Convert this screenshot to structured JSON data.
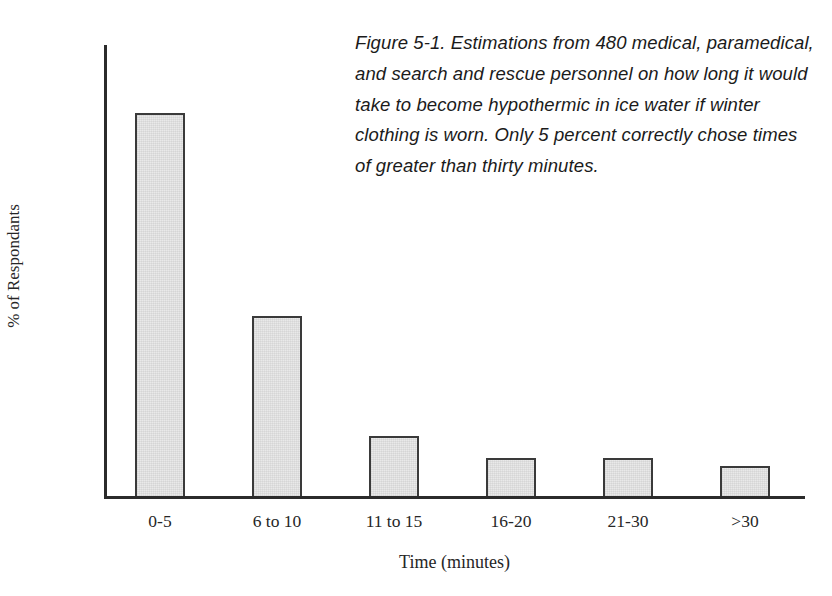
{
  "caption": {
    "text": "Figure 5-1. Estimations from 480 medical, paramedical, and search and rescue personnel on how long it would take to become hypothermic in ice water if winter clothing is worn. Only 5 percent correctly chose times of greater than thirty minutes."
  },
  "colors": {
    "bar_fill": "#e9e9e9",
    "bar_edge": "#3a3a3a",
    "axis": "#2b2b2b",
    "text": "#262626",
    "background": "#ffffff"
  },
  "chart_data": {
    "type": "bar",
    "title": "",
    "categories": [
      "0-5",
      "6 to 10",
      "11 to 15",
      "16-20",
      "21-30",
      ">30"
    ],
    "values": [
      51,
      24,
      8,
      5,
      5,
      4
    ],
    "xlabel": "Time (minutes)",
    "ylabel": "% of Respondants",
    "ylim": [
      0,
      60
    ],
    "yticks": [
      0,
      10,
      20,
      30,
      40,
      50,
      60
    ],
    "ytick_labels": [
      "0",
      "10",
      "20",
      "30",
      "40",
      "50",
      "60"
    ],
    "grid": false,
    "legend": null,
    "annotations": []
  }
}
